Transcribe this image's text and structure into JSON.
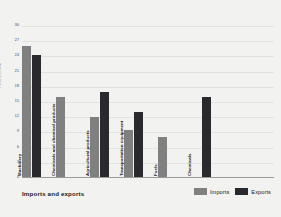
{
  "chart_data": {
    "type": "bar",
    "title": "Imports and exports",
    "xlabel": "",
    "ylabel": "Percent of total",
    "ylim": [
      0,
      30
    ],
    "yticks": [
      30,
      27,
      24,
      21,
      18,
      15,
      12,
      9,
      6,
      3,
      0
    ],
    "grid": true,
    "legend_position": "bottom-right",
    "categories": [
      "Machinery",
      "Chemicals and chemical products",
      "Agricultural products",
      "Transportation equipment",
      "Fuels",
      "Chemicals"
    ],
    "series": [
      {
        "name": "Imports",
        "color": "#808080",
        "values": [
          26.0,
          16.0,
          12.0,
          9.5,
          8.0,
          0
        ]
      },
      {
        "name": "Exports",
        "color": "#2a2a2e",
        "values": [
          24.3,
          0,
          17.0,
          13.0,
          0,
          16.0
        ]
      }
    ]
  },
  "legend": {
    "items": [
      {
        "label": "Imports",
        "color": "#808080"
      },
      {
        "label": "Exports",
        "color": "#2a2a2e"
      }
    ]
  },
  "colors": {
    "imports": "#808080",
    "exports": "#2a2a2e",
    "background": "#f2f2f0",
    "grid": "#e2e2df",
    "axis": "#9b9b98"
  }
}
